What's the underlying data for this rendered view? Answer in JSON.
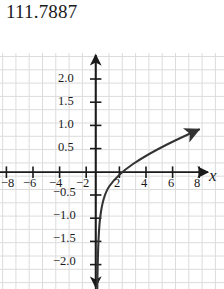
{
  "title": "111.7887",
  "axes": {
    "x_label": "x",
    "y_label": "y"
  },
  "chart_data": {
    "type": "line",
    "title": "111.7887",
    "xlabel": "x",
    "ylabel": "y",
    "grid": true,
    "legend": null,
    "xlim": [
      -9.2,
      9.8
    ],
    "ylim": [
      -2.4,
      2.3
    ],
    "x_ticks": [
      -8,
      -6,
      -4,
      -2,
      2,
      4,
      6,
      8
    ],
    "x_tick_labels": [
      "−8",
      "−6",
      "−4",
      "−2",
      "2",
      "4",
      "6",
      "8"
    ],
    "y_ticks": [
      2.0,
      1.5,
      1.0,
      0.5,
      -0.5,
      -1.0,
      -1.5,
      -2.0
    ],
    "y_tick_labels": [
      "2.0",
      "1.5",
      "1.0",
      "0.5",
      "−0.5",
      "−1.0",
      "−1.5",
      "−2.0"
    ],
    "curve_color": "#333333",
    "grid_color": "#dcdcdc",
    "axis_color": "#1a1a1a",
    "series": [
      {
        "name": "y = log(x)",
        "x": [
          0.13,
          0.16,
          0.2,
          0.25,
          0.32,
          0.4,
          0.5,
          0.63,
          0.8,
          1.0,
          1.3,
          1.6,
          2.0,
          2.5,
          3.2,
          4.0,
          5.0,
          6.3,
          8.0,
          9.5
        ],
        "y": [
          -2.05,
          -1.83,
          -1.61,
          -1.39,
          -1.14,
          -0.92,
          -0.69,
          -0.46,
          -0.22,
          0.0,
          0.26,
          0.47,
          0.69,
          0.92,
          1.16,
          1.39,
          1.61,
          1.84,
          2.08,
          2.25
        ]
      }
    ],
    "curve_pixel_path": "M 95.0,235 C 95.4,215 96.2,196 97.8,186 C 99.6,175 101.6,168 105,163 C 110,155 117,149 126,144 C 137,138 150,133 165,128.5 C 180,124.5 192,121.5 203,119"
  },
  "xlabels": [
    {
      "text": "−8",
      "left": 1,
      "top": 176
    },
    {
      "text": "−6",
      "left": 23,
      "top": 176
    },
    {
      "text": "−4",
      "left": 49,
      "top": 176
    },
    {
      "text": "−2",
      "left": 76,
      "top": 176
    },
    {
      "text": "2",
      "left": 114,
      "top": 176
    },
    {
      "text": "4",
      "left": 141,
      "top": 176
    },
    {
      "text": "6",
      "left": 168,
      "top": 176
    },
    {
      "text": "8",
      "left": 194,
      "top": 176
    }
  ],
  "ylabels": [
    {
      "text": "2.0",
      "left": 58,
      "top": 71
    },
    {
      "text": "1.5",
      "left": 58,
      "top": 94
    },
    {
      "text": "1.0",
      "left": 58,
      "top": 117
    },
    {
      "text": "0.5",
      "left": 58,
      "top": 140
    },
    {
      "text": "−0.5",
      "left": 53,
      "top": 185
    },
    {
      "text": "−1.0",
      "left": 53,
      "top": 208
    },
    {
      "text": "−1.5",
      "left": 53,
      "top": 231
    },
    {
      "text": "−2.0",
      "left": 53,
      "top": 254
    }
  ]
}
